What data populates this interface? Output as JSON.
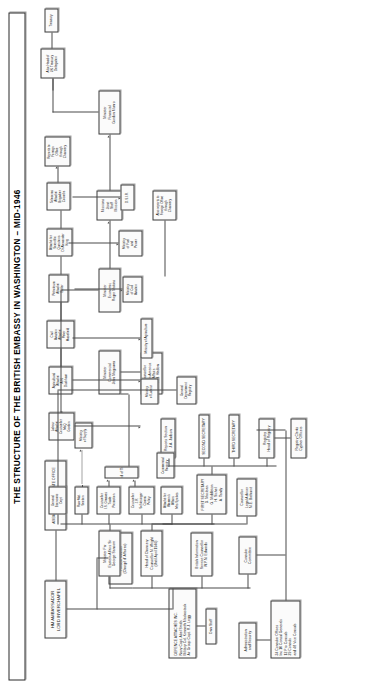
{
  "title": "THE STRUCTURE OF THE BRITISH EMBASSY IN WASHINGTON – MID-1946",
  "nodes": {
    "ambassador": {
      "lines": [
        "HM AMBASSADOR",
        "LORD INVERCHAPEL"
      ]
    },
    "private_office": {
      "lines": [
        "AMBASSADOR'S PRIVATE OFFICE",
        "Walter Bell"
      ]
    },
    "political_minister": {
      "lines": [
        "JOHN BALFOUR",
        "Political Minister",
        "(Chargé d' Affaires)"
      ]
    },
    "defence_attaches": {
      "lines": [
        "DEFENCE ATTACHÉS INC.",
        "Navy Capt. Abel Smith",
        "Military Col. Kenneth Mackastack",
        "Air Group Capt. R.J. Legg"
      ]
    },
    "own_staff": {
      "lines": [
        "Own Staff"
      ]
    },
    "administration": {
      "lines": [
        "Administration",
        "and Security"
      ]
    },
    "consular_offices": {
      "lines": [
        "34 Consular Offices",
        "Inc 10 Consul Generals",
        "12 Pro Consuls",
        "29 Consuls",
        "and 48 Vice Consuls"
      ]
    },
    "consular_committee": {
      "lines": [
        "Consular",
        "Committee"
      ]
    },
    "bis": {
      "lines": [
        "British Information",
        "Service Counsellor",
        "W.P.N. Edwards"
      ]
    },
    "head_chancery": {
      "lines": [
        "Head of Chancery",
        "Counsellor M. Wright",
        "(Until April 1946)"
      ]
    },
    "first_secretary": {
      "lines": [
        "FIRST SECRETARY",
        "D. Maclean",
        "G. Middleton",
        "H. Sichel",
        "A. Tandy"
      ]
    },
    "legal_adviser": {
      "lines": [
        "Counsellor",
        "Legal Adviser",
        "M.E. Bathurst"
      ]
    },
    "second_secretary": {
      "lines": [
        "SECOND SECRETARY"
      ]
    },
    "third_secretary": {
      "lines": [
        "THIRD SECRETARY"
      ]
    },
    "reports_section": {
      "lines": [
        "Reports Section",
        "J.A. Judson"
      ]
    },
    "registry_head": {
      "lines": [
        "Registry",
        "Head of Registry"
      ]
    },
    "registry_clerks": {
      "lines": [
        "Registry Clerks",
        "Cypher Officers"
      ]
    },
    "minister_far_east": {
      "lines": [
        "Minister Far",
        "Eastern Affairs Sir",
        "George Sansom"
      ]
    },
    "minister_commercial": {
      "lines": [
        "Minister",
        "Commercial",
        "John Magowan"
      ]
    },
    "minister_economic": {
      "lines": [
        "Minister",
        "Economic",
        "Roger Makins"
      ]
    },
    "minister_financial": {
      "lines": [
        "Minister",
        "Financial",
        "Gordon Munro"
      ]
    },
    "counsellor_latin": {
      "lines": [
        "Counsellor",
        "Latin America",
        "Affairs",
        "R.H. Hadow"
      ]
    },
    "attache_womens": {
      "lines": [
        "Attaché for",
        "Women's",
        "Affairs",
        "Mrs Spokes"
      ]
    },
    "counsellor_comm_policy": {
      "lines": [
        "Counsellor",
        "J.R.",
        "Schlesinger",
        "Comm.",
        "Policy"
      ]
    },
    "counsellor_trade": {
      "lines": [
        "Counsellor",
        "I.S. Greaves",
        "Trade",
        "Promotion"
      ]
    },
    "raw_mat_section": {
      "lines": [
        "Raw Mat.",
        "Section"
      ]
    },
    "gen_economic_dept": {
      "lines": [
        "General",
        "Economic",
        "Dept"
      ]
    },
    "labour_attache": {
      "lines": [
        "Labour",
        "Attaché",
        "Counsellor",
        "McQ",
        "Gordon"
      ]
    },
    "agri_attache": {
      "lines": [
        "Agricultural",
        "Attaché",
        "A.N.",
        "Duckham"
      ]
    },
    "civil_aviation_attache": {
      "lines": [
        "Civil",
        "Aviation",
        "Attaché",
        "Peter",
        "Masefield"
      ]
    },
    "petroleum_attache": {
      "lines": [
        "Petroleum",
        "Attaché",
        "Butler"
      ]
    },
    "scientific_attache": {
      "lines": [
        "Attaché for",
        "Scientific",
        "Questions",
        "Dr Alexander",
        "King"
      ]
    },
    "telecoms_attache": {
      "lines": [
        "Telecoms",
        "Attaché",
        "Brigadier",
        "Coombs"
      ]
    },
    "missions_joint_staff": {
      "lines": [
        "Missions",
        "Joint",
        "Staff",
        "Mission"
      ]
    },
    "board_of_trade": {
      "lines": [
        "Board of Trade"
      ]
    },
    "commercial_registry": {
      "lines": [
        "Commercial",
        "Registry"
      ]
    },
    "general_dept_registry": {
      "lines": [
        "General",
        "Department",
        "Registry"
      ]
    },
    "ministry_supply": {
      "lines": [
        "Ministry",
        "of Supply"
      ]
    },
    "ministry_labour": {
      "lines": [
        "Ministry",
        "of Labour"
      ]
    },
    "ministry_agriculture": {
      "lines": [
        "Ministry of Agriculture"
      ]
    },
    "ministry_civil_aviation": {
      "lines": [
        "Ministry",
        "of Civil",
        "Aviation"
      ]
    },
    "ministry_fuel_power": {
      "lines": [
        "Ministry",
        "of Fuel",
        "and",
        "Power"
      ]
    },
    "dsir": {
      "lines": [
        "D.S.I.R."
      ]
    },
    "reports_fo_chancery": {
      "lines": [
        "Reports to",
        "Foreign",
        "Office",
        "through",
        "Chancery"
      ]
    },
    "also_reports_fo": {
      "lines": [
        "Also reports to",
        "Foreign Office",
        "through",
        "Chancery"
      ]
    },
    "uk_treasury_delegation": {
      "lines": [
        "Also Head of",
        "UK Treasury",
        "Delegation"
      ]
    },
    "treasury": {
      "lines": [
        "Treasury"
      ]
    }
  }
}
